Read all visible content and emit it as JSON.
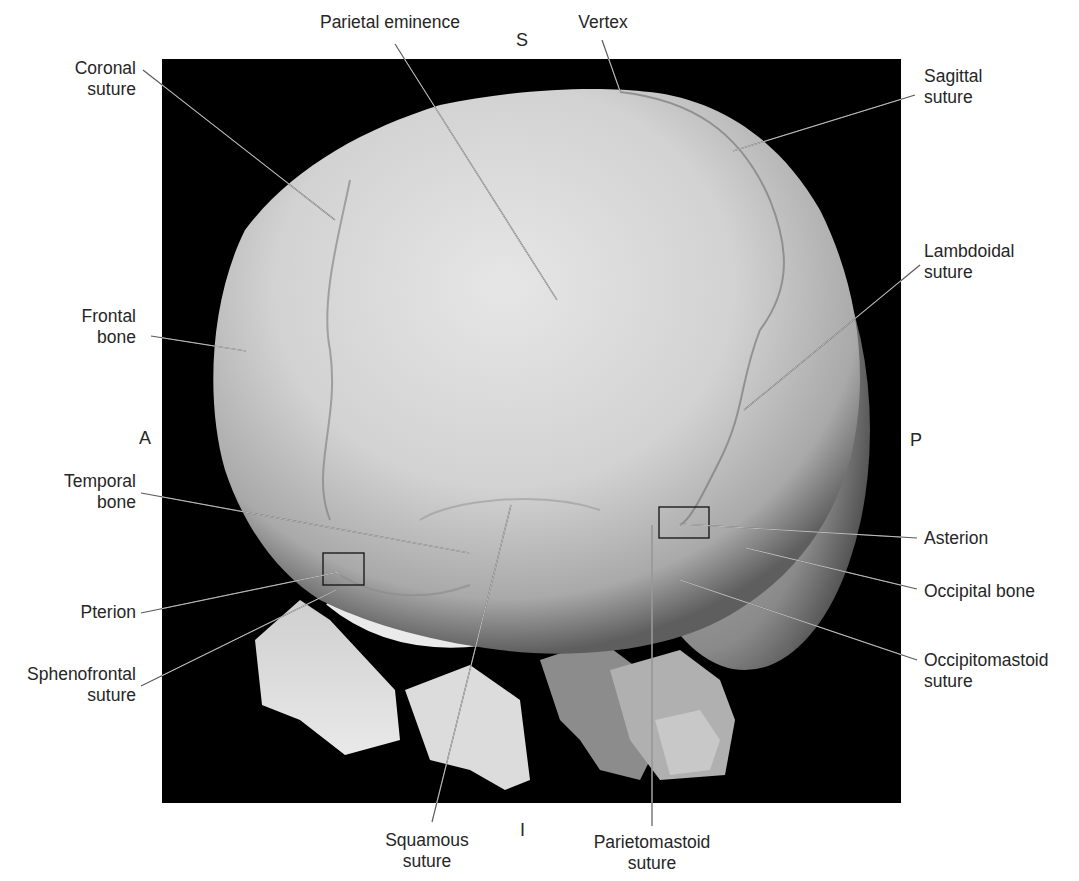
{
  "figure": {
    "type": "3D CT reconstruction of infant skull, lateral view",
    "panel": {
      "x": 162,
      "y": 59,
      "width": 739,
      "height": 744,
      "background": "#000000"
    },
    "bone_color": "#d9d9d9"
  },
  "orientation": {
    "superior": "S",
    "inferior": "I",
    "anterior": "A",
    "posterior": "P"
  },
  "labels": [
    {
      "id": "coronal-suture",
      "lines": [
        "Coronal",
        "suture"
      ],
      "align": "right",
      "box": [
        108,
        59,
        136
      ],
      "leader": [
        [
          143,
          70
        ],
        [
          335,
          220
        ]
      ]
    },
    {
      "id": "parietal-eminence",
      "lines": [
        "Parietal eminence"
      ],
      "align": "center",
      "box": [
        310,
        10,
        160
      ],
      "leader": [
        [
          395,
          44
        ],
        [
          557,
          300
        ]
      ]
    },
    {
      "id": "vertex",
      "lines": [
        "Vertex"
      ],
      "align": "center",
      "box": [
        567,
        10,
        70
      ],
      "leader": [
        [
          602,
          40
        ],
        [
          620,
          91
        ]
      ]
    },
    {
      "id": "sagittal-suture",
      "lines": [
        "Sagittal",
        "suture"
      ],
      "align": "left",
      "box": [
        924,
        66,
        100
      ],
      "leader": [
        [
          915,
          95
        ],
        [
          733,
          151
        ]
      ]
    },
    {
      "id": "frontal-bone",
      "lines": [
        "Frontal",
        "bone"
      ],
      "align": "right",
      "box": [
        70,
        307,
        66
      ],
      "leader": [
        [
          151,
          336
        ],
        [
          246,
          351
        ]
      ]
    },
    {
      "id": "lambdoidal-suture",
      "lines": [
        "Lambdoidal",
        "suture"
      ],
      "align": "left",
      "box": [
        924,
        240,
        120
      ],
      "leader": [
        [
          920,
          265
        ],
        [
          744,
          410
        ]
      ]
    },
    {
      "id": "temporal-bone",
      "lines": [
        "Temporal",
        "bone"
      ],
      "align": "right",
      "box": [
        52,
        470,
        84
      ],
      "leader": [
        [
          141,
          493
        ],
        [
          469,
          553
        ]
      ]
    },
    {
      "id": "asterion",
      "lines": [
        "Asterion"
      ],
      "align": "left",
      "box": [
        924,
        528,
        100
      ],
      "leader": [
        [
          917,
          538
        ],
        [
          680,
          524
        ]
      ]
    },
    {
      "id": "occipital-bone",
      "lines": [
        "Occipital bone"
      ],
      "align": "left",
      "box": [
        924,
        580,
        140
      ],
      "leader": [
        [
          917,
          589
        ],
        [
          746,
          548
        ]
      ]
    },
    {
      "id": "pterion",
      "lines": [
        "Pterion"
      ],
      "align": "right",
      "box": [
        70,
        601,
        66
      ],
      "leader": [
        [
          141,
          613
        ],
        [
          339,
          572
        ]
      ]
    },
    {
      "id": "occipitomastoid-suture",
      "lines": [
        "Occipitomastoid",
        "suture"
      ],
      "align": "left",
      "box": [
        924,
        651,
        150
      ],
      "leader": [
        [
          917,
          660
        ],
        [
          680,
          580
        ]
      ]
    },
    {
      "id": "sphenofrontal-suture",
      "lines": [
        "Sphenofrontal",
        "suture"
      ],
      "align": "right",
      "box": [
        8,
        663,
        128
      ],
      "leader": [
        [
          141,
          686
        ],
        [
          336,
          590
        ]
      ]
    },
    {
      "id": "squamous-suture",
      "lines": [
        "Squamous",
        "suture"
      ],
      "align": "center",
      "box": [
        380,
        829,
        90
      ],
      "leader": [
        [
          432,
          822
        ],
        [
          511,
          505
        ]
      ]
    },
    {
      "id": "parietomastoid-suture",
      "lines": [
        "Parietomastoid",
        "suture"
      ],
      "align": "center",
      "box": [
        578,
        831,
        146
      ],
      "leader": [
        [
          652,
          826
        ],
        [
          652,
          525
        ]
      ]
    }
  ],
  "boxes": [
    {
      "id": "pterion-box",
      "x": 323,
      "y": 553,
      "w": 41,
      "h": 32
    },
    {
      "id": "asterion-box",
      "x": 659,
      "y": 507,
      "w": 50,
      "h": 31
    }
  ]
}
